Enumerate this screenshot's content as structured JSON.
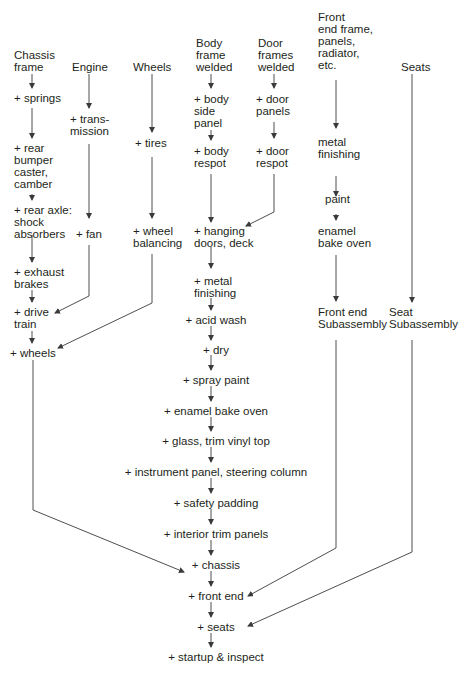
{
  "diagram": {
    "columns": {
      "chassis": {
        "header": "Chassis\nframe",
        "steps": [
          "+ springs",
          "+ rear\nbumper\ncaster,\ncamber",
          "+ rear axle:\nshock\nabsorbers",
          "+ exhaust\nbrakes",
          "+ drive\ntrain",
          "+ wheels"
        ]
      },
      "engine": {
        "header": "Engine",
        "steps": [
          "+ trans-\nmission",
          "+ fan"
        ]
      },
      "wheels": {
        "header": "Wheels",
        "steps": [
          "+ tires",
          "+ wheel\nbalancing"
        ]
      },
      "body": {
        "header": "Body\nframe\nwelded",
        "steps": [
          "+ body\nside\npanel",
          "+ body\nrespot"
        ]
      },
      "doors": {
        "header": "Door\nframes\nwelded",
        "steps": [
          "+ door\npanels",
          "+ door\nrespot"
        ]
      },
      "front_end": {
        "header": "Front\nend frame,\npanels,\nradiator,\netc.",
        "steps": [
          "metal\nfinishing",
          "paint",
          "enamel\nbake oven",
          "Front end\nSubassembly"
        ]
      },
      "seats": {
        "header": "Seats",
        "steps": [
          "Seat\nSubassembly"
        ]
      }
    },
    "main_line": [
      "+ hanging\ndoors, deck",
      "+ metal\nfinishing",
      "+ acid wash",
      "+ dry",
      "+ spray paint",
      "+ enamel bake oven",
      "+ glass, trim vinyl top",
      "+ instrument panel, steering column",
      "+ safety padding",
      "+ interior trim panels",
      "+ chassis",
      "+ front end",
      "+ seats",
      "+ startup & inspect"
    ]
  }
}
